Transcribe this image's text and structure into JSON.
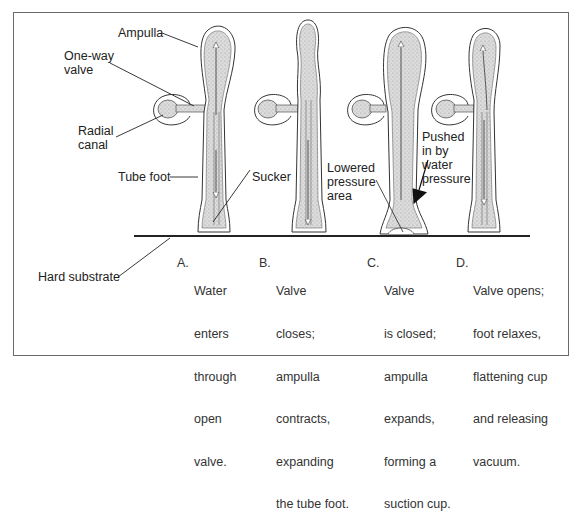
{
  "labels": {
    "ampulla": "Ampulla",
    "one_way_valve": [
      "One-way",
      "valve"
    ],
    "radial_canal": [
      "Radial",
      "canal"
    ],
    "tube_foot": "Tube foot",
    "sucker": "Sucker",
    "hard_substrate": "Hard substrate",
    "lowered_pressure_area": [
      "Lowered",
      "pressure",
      "area"
    ],
    "pushed_in_by_water_pressure": [
      "Pushed",
      "in by",
      "water",
      "pressure"
    ]
  },
  "stages": [
    {
      "letter": "A.",
      "lines": [
        "Water",
        "enters",
        "through",
        "open",
        "valve."
      ]
    },
    {
      "letter": "B.",
      "lines": [
        "Valve",
        "closes;",
        "ampulla",
        "contracts,",
        "expanding",
        "the tube foot."
      ]
    },
    {
      "letter": "C.",
      "lines": [
        "Valve",
        "is closed;",
        "ampulla",
        "expands,",
        "forming a",
        "suction cup."
      ]
    },
    {
      "letter": "D.",
      "lines": [
        "Valve opens;",
        "foot relaxes,",
        "flattening cup",
        "and releasing",
        "vacuum."
      ]
    }
  ],
  "colors": {
    "line": "#2a2a2a",
    "fill": "#d9d9d9",
    "frame": "#6a6a6a"
  }
}
